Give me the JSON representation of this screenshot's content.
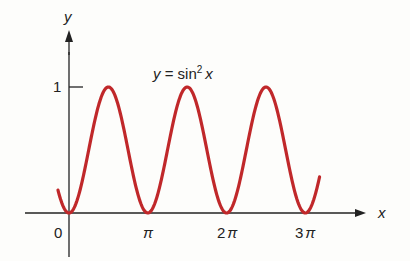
{
  "chart_data": {
    "type": "line",
    "title_parts": {
      "lhs": "y",
      "eq": " = sin",
      "exp": "2",
      "var": "x"
    },
    "xlabel": "x",
    "ylabel": "y",
    "x_ticks": [
      "0",
      "π",
      "2π",
      "3π"
    ],
    "y_ticks": [
      "1"
    ],
    "xlim": [
      -0.45,
      3.2
    ],
    "ylim": [
      0,
      1
    ],
    "grid": false,
    "legend": null,
    "series": [
      {
        "name": "y = sin²x",
        "function": "sin(x)^2",
        "x_range_pi": [
          -0.14,
          3.18
        ],
        "color": "#c0282a"
      }
    ],
    "sample_points": [
      {
        "x": "0",
        "y": 0
      },
      {
        "x": "π/2",
        "y": 1
      },
      {
        "x": "π",
        "y": 0
      },
      {
        "x": "3π/2",
        "y": 1
      },
      {
        "x": "2π",
        "y": 0
      },
      {
        "x": "5π/2",
        "y": 1
      },
      {
        "x": "3π",
        "y": 0
      }
    ]
  },
  "labels": {
    "y_axis": "y",
    "x_axis": "x",
    "tick_0": "0",
    "tick_pi": "π",
    "tick_2pi_num": "2",
    "tick_3pi_num": "3",
    "pi": "π",
    "tick_1": "1",
    "title_lhs": "y",
    "title_eq": " = sin",
    "title_exp": "2",
    "title_var": "x"
  },
  "colors": {
    "curve": "#c0282a",
    "axis": "#222222"
  }
}
